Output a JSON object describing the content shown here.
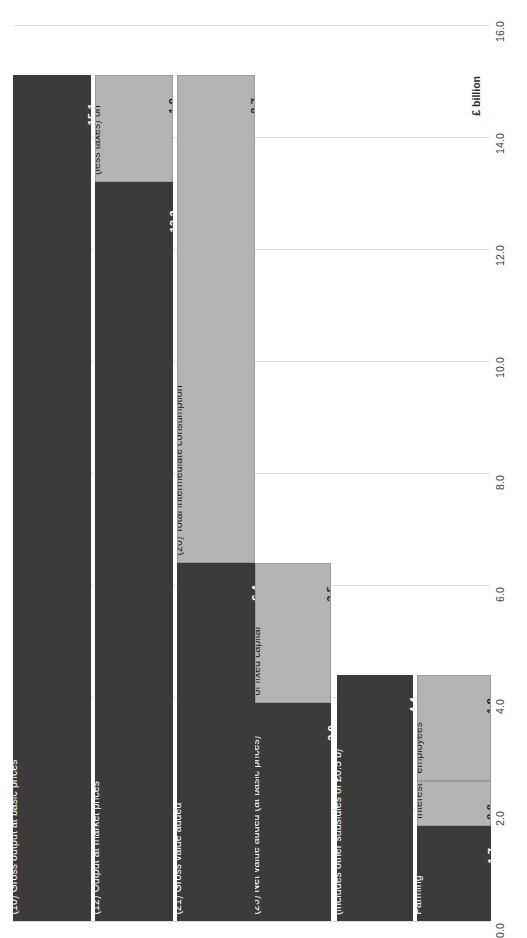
{
  "chart_data": {
    "type": "bar",
    "title": "",
    "subtitle": "",
    "xlabel": "",
    "ylabel": "£ billion",
    "unit_label": "£ billion",
    "ylim": [
      0.0,
      16.0
    ],
    "grid": true,
    "legend": "none",
    "axis_side": "right",
    "orientation": "vertical-stacked",
    "tick_labels": [
      "0.0",
      "2.0",
      "4.0",
      "6.0",
      "8.0",
      "10.0",
      "12.0",
      "14.0",
      "16.0"
    ],
    "tick_values": [
      0.0,
      2.0,
      4.0,
      6.0,
      8.0,
      10.0,
      12.0,
      14.0,
      16.0
    ],
    "categories": [
      "Gross output at basic prices",
      "Output at market prices",
      "Gross value added",
      "Net value added (at basic prices)",
      "Net value added at factor cost",
      "Total Income From Farming"
    ],
    "bars": [
      {
        "index": 1,
        "total": 15.1,
        "segments": [
          {
            "code": "(10)",
            "label": "(10) Gross output at basic prices",
            "value": 15.1,
            "value_label": "15.1",
            "base": 0.0,
            "shade": "dark"
          }
        ]
      },
      {
        "index": 2,
        "total": 15.1,
        "segments": [
          {
            "code": "(11)",
            "label": "(11) Subsidies\n(less taxes) on",
            "value": 1.9,
            "value_label": "1.9",
            "base": 13.2,
            "shade": "light"
          },
          {
            "code": "(12)",
            "label": "(12) Output at market prices",
            "value": 13.2,
            "value_label": "13.2",
            "base": 0.0,
            "shade": "dark"
          }
        ]
      },
      {
        "index": 3,
        "total": 15.1,
        "segments": [
          {
            "code": "(20)",
            "label": "(20) Total intermediate consumption",
            "value": 8.7,
            "value_label": "8.7",
            "base": 6.4,
            "shade": "light"
          },
          {
            "code": "(21)",
            "label": "(21) Gross value added",
            "value": 6.4,
            "value_label": "6.4",
            "base": 0.0,
            "shade": "dark"
          }
        ]
      },
      {
        "index": 4,
        "total": 6.4,
        "segments": [
          {
            "code": "(22)",
            "label": "(22)\nConsumption\nof fixed capital",
            "value": 2.5,
            "value_label": "2.5",
            "base": 3.9,
            "shade": "light"
          },
          {
            "code": "(23)",
            "label": "(23) Net value added (at basic prices)",
            "value": 3.9,
            "value_label": "3.9",
            "base": 0.0,
            "shade": "dark"
          }
        ]
      },
      {
        "index": 5,
        "total": 4.4,
        "segments": [
          {
            "code": "(25)",
            "label": "(25) Net value added at factor cost\n(includes other subsidies of £0.5 b)",
            "value": 4.4,
            "value_label": "4.4",
            "base": 0.0,
            "shade": "dark"
          }
        ]
      },
      {
        "index": 6,
        "total": 4.4,
        "segments": [
          {
            "code": "(26)",
            "label": "(26)\nCompensation of\nemployees",
            "value": 1.9,
            "value_label": "1.9",
            "base": 2.5,
            "shade": "light"
          },
          {
            "code": "(28)(27)",
            "label": "(28)\nRent &\n(27)\nInterest",
            "value": 0.8,
            "value_label": "0.8",
            "base": 1.7,
            "shade": "light"
          },
          {
            "code": "(29)",
            "label": "(29) Total\nIncome From\nFarming",
            "value": 1.7,
            "value_label": "1.7",
            "base": 0.0,
            "shade": "dark"
          }
        ]
      }
    ],
    "colors": {
      "dark": "#3b3b3b",
      "light": "#b4b4b4",
      "gridline": "#e2e2e2",
      "background": "#ffffff",
      "dark_text": "#ffffff",
      "light_text": "#1f1f1f"
    }
  }
}
